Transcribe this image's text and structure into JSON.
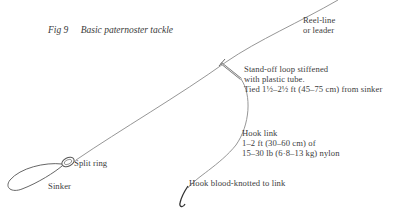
{
  "figure": {
    "number": "Fig 9",
    "title": "Basic paternoster tackle"
  },
  "labels": {
    "reel_line": [
      "Reel-line",
      "or leader"
    ],
    "stand_off_loop": [
      "Stand-off loop stiffened",
      "with plastic tube.",
      "Tied 1½–2½ ft (45–75 cm) from sinker"
    ],
    "hook_link": [
      "Hook link",
      "1–2 ft (30–60 cm) of",
      "15–30 lb (6·8–13 kg) nylon"
    ],
    "hook": "Hook blood-knotted to link",
    "split_ring": "Split ring",
    "sinker": "Sinker"
  },
  "colors": {
    "line": "#7a7a7a",
    "text": "#3c3c3c",
    "background": "#ffffff"
  }
}
